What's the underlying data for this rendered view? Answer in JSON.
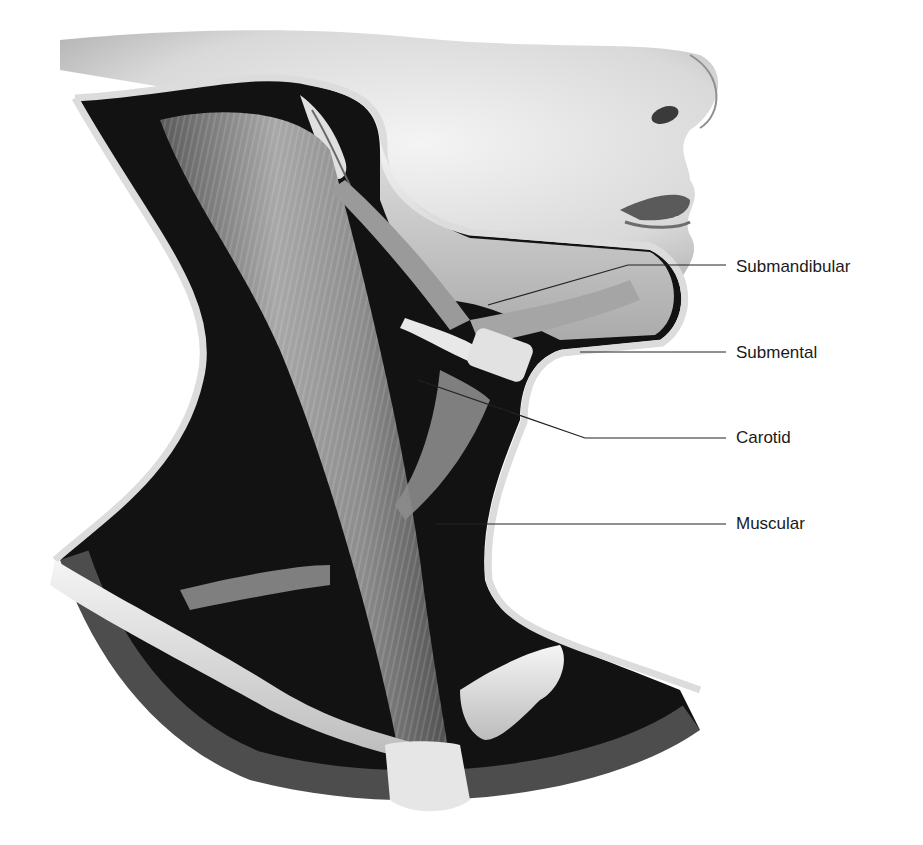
{
  "figure": {
    "colors": {
      "background": "#ffffff",
      "skin_light": "#f2f2f2",
      "skin_shadow": "#9a9a9a",
      "cavity_dark": "#121212",
      "muscle": "#8a8a8a",
      "bone": "#e6e6e6",
      "outline": "#d8d8d8",
      "leader_line": "#222222",
      "label_text": "#1a1a1a"
    }
  },
  "labels": [
    {
      "id": "submandibular",
      "text": "Submandibular",
      "x": 736,
      "y": 258
    },
    {
      "id": "submental",
      "text": "Submental",
      "x": 736,
      "y": 344
    },
    {
      "id": "carotid",
      "text": "Carotid",
      "x": 736,
      "y": 429
    },
    {
      "id": "muscular",
      "text": "Muscular",
      "x": 736,
      "y": 515
    }
  ]
}
